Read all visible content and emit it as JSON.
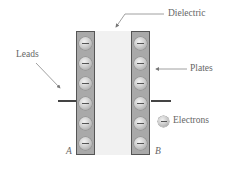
{
  "diagram": {
    "labels": {
      "dielectric": "Dielectric",
      "leads": "Leads",
      "plates": "Plates",
      "electrons": "Electrons",
      "plate_a": "A",
      "plate_b": "B"
    },
    "plates": [
      {
        "id": "A",
        "electron_count": 6,
        "charge_sign": "−"
      },
      {
        "id": "B",
        "electron_count": 6,
        "charge_sign": "−"
      }
    ],
    "colors": {
      "plate_fill": "#a9a9a9",
      "plate_border": "#555555",
      "dielectric_fill": "#f1f1f1",
      "lead": "#444444",
      "label_text": "#666666"
    },
    "legend": {
      "icon": "electron-icon",
      "label": "Electrons"
    }
  }
}
